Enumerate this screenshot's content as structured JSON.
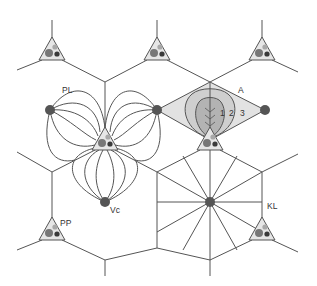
{
  "figure": {
    "type": "liver-lobule-schematic",
    "labels": {
      "portal_lobule": "PL",
      "acinus": "A",
      "zone1": "1",
      "zone2": "2",
      "zone3": "3",
      "central_vein": "Vc",
      "portal_triad": "PP",
      "classic_lobule": "KL"
    },
    "colors": {
      "line": "#555555",
      "vein": "#555555",
      "triad_fill": "#e6e6e6",
      "triad_light": "#a8a8a8",
      "triad_mid": "#777777",
      "triad_dark": "#3a3a3a",
      "acinus_zone3": "#e2e2e2",
      "acinus_zone2": "#cfcfcf",
      "acinus_zone1": "#b3b3b3"
    }
  }
}
